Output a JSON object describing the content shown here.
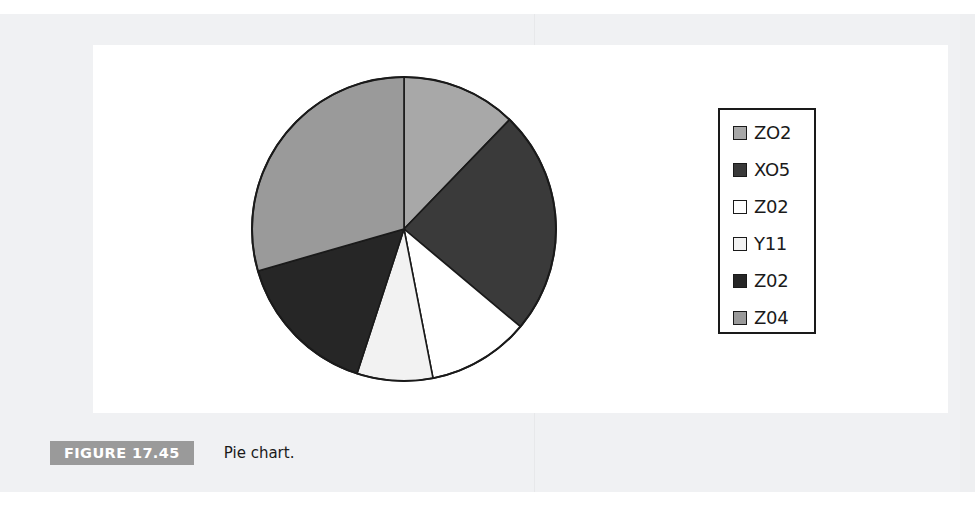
{
  "figure": {
    "caption_tag": "FIGURE 17.45",
    "caption_text": "Pie chart."
  },
  "legend": {
    "items": [
      {
        "label": "ZO2",
        "color": "#a8a8a8"
      },
      {
        "label": "XO5",
        "color": "#3a3a3a"
      },
      {
        "label": "Z02",
        "color": "#ffffff"
      },
      {
        "label": "Y11",
        "color": "#f2f2f2"
      },
      {
        "label": "Z02",
        "color": "#262626"
      },
      {
        "label": "Z04",
        "color": "#9a9a9a"
      }
    ]
  },
  "chart_data": {
    "type": "pie",
    "title": "Pie chart.",
    "legend_position": "right",
    "start_angle_deg": 0,
    "direction": "clockwise",
    "center": {
      "x": 404,
      "y": 229
    },
    "radius": 152,
    "categories": [
      "ZO2",
      "XO5",
      "Z02",
      "Y11",
      "Z02",
      "Z04"
    ],
    "slice_angles_deg": [
      44,
      86,
      39,
      29,
      56,
      106
    ],
    "values": [
      12.2,
      23.9,
      10.8,
      8.1,
      15.6,
      29.4
    ],
    "colors": [
      "#a8a8a8",
      "#3a3a3a",
      "#ffffff",
      "#f2f2f2",
      "#262626",
      "#9a9a9a"
    ],
    "boundary_angles_deg": [
      0,
      44,
      130,
      169,
      198,
      254,
      360
    ],
    "stroke": "#1a1a1a",
    "grid": false
  },
  "ghost_text": {
    "line1": "",
    "line2": ""
  }
}
